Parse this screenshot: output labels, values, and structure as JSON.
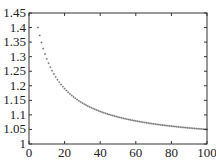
{
  "chart_data": {
    "type": "scatter",
    "title": "",
    "xlabel": "",
    "ylabel": "",
    "xlim": [
      0,
      100
    ],
    "ylim": [
      1,
      1.45
    ],
    "grid": false,
    "legend": null,
    "x_ticks": [
      0,
      20,
      40,
      60,
      80,
      100
    ],
    "x_tick_labels": [
      "0",
      "20",
      "40",
      "60",
      "80",
      "100"
    ],
    "y_ticks": [
      1,
      1.05,
      1.1,
      1.15,
      1.2,
      1.25,
      1.3,
      1.35,
      1.4,
      1.45
    ],
    "y_tick_labels": [
      "1",
      "1.05",
      "1.1",
      "1.15",
      "1.2",
      "1.25",
      "1.3",
      "1.35",
      "1.4",
      "1.45"
    ],
    "marker": "+",
    "marker_color": "#555555",
    "series": [
      {
        "name": "data",
        "model": "y = 1 + 5.43/(x + 8.57)",
        "x_start": 5,
        "x_end": 100,
        "x_step": 1,
        "sample_points": [
          [
            5,
            1.4
          ],
          [
            10,
            1.29
          ],
          [
            20,
            1.19
          ],
          [
            30,
            1.14
          ],
          [
            40,
            1.11
          ],
          [
            50,
            1.09
          ],
          [
            60,
            1.08
          ],
          [
            70,
            1.07
          ],
          [
            80,
            1.06
          ],
          [
            90,
            1.055
          ],
          [
            100,
            1.05
          ]
        ]
      }
    ]
  }
}
